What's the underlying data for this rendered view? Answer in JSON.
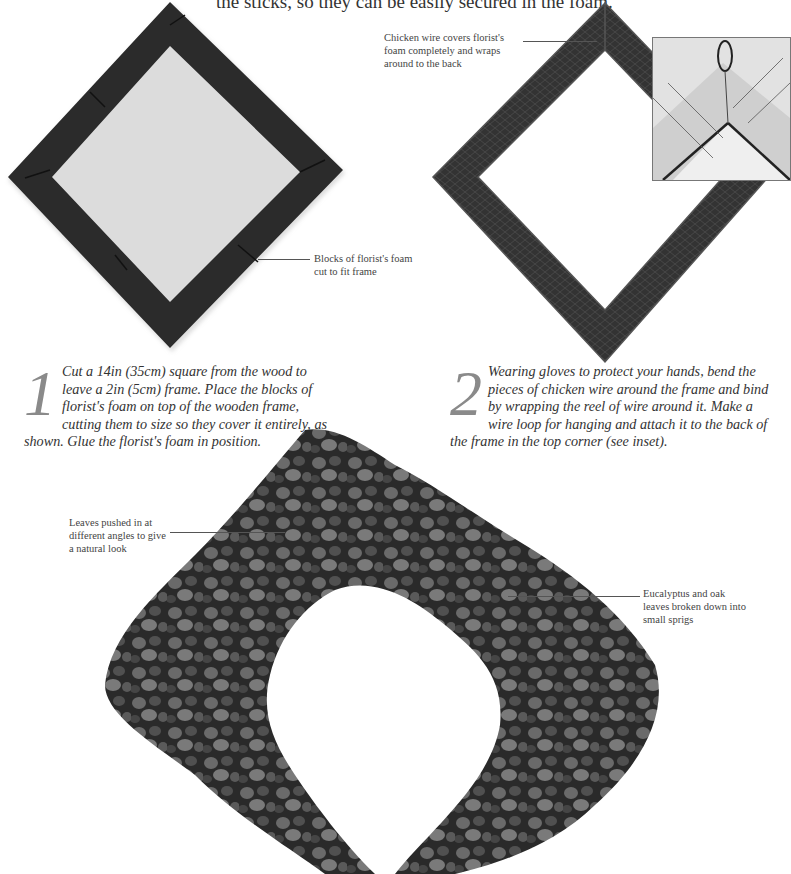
{
  "header": {
    "partial_text": "the sticks, so they can be easily secured in the foam."
  },
  "figures": {
    "foam_frame": {
      "alt": "Square frame with blocks of dark florist's foam, rotated as a diamond",
      "callout": "Blocks of florist's foam cut to fit frame"
    },
    "wired_frame": {
      "alt": "Frame covered with chicken wire",
      "callout": "Chicken wire covers florist's foam completely and wraps around to the back",
      "inset_alt": "Inset: wire loop for hanging at the back top corner"
    },
    "wreath": {
      "alt": "Finished wreath of eucalyptus and oak leaves",
      "callout_left": "Leaves pushed in at different angles to give a natural look",
      "callout_right": "Eucalyptus and oak leaves broken down into small sprigs"
    }
  },
  "steps": [
    {
      "number": "1",
      "text": "Cut a 14in (35cm) square from the wood  to leave a 2in (5cm) frame. Place the blocks of florist's foam on top of the wooden frame, cutting them to size so they cover it entirely, as shown. Glue the florist's foam in position."
    },
    {
      "number": "2",
      "text": "Wearing gloves to protect your hands, bend the pieces of chicken wire around the frame and bind by wrapping the reel of wire around it. Make a wire loop for hanging and attach it to the back of the frame in the top corner (see inset)."
    }
  ],
  "colors": {
    "foam": "#2b2b2b",
    "leaf_dark": "#1e1e1e",
    "leaf_mid": "#5a5a5a",
    "leaf_light": "#8a8a8a",
    "text": "#333333",
    "drop_cap": "#8a8a8a"
  }
}
